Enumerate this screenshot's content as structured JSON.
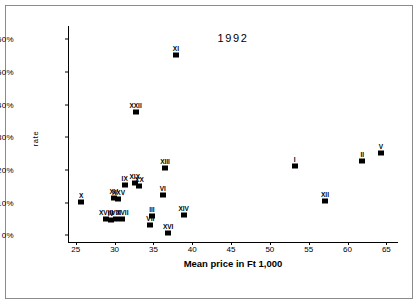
{
  "chart_data": {
    "type": "scatter",
    "title": "1992",
    "xlabel": "Mean price in Ft 1,000",
    "ylabel": "rate",
    "xlim": [
      24,
      66.5
    ],
    "ylim": [
      -2,
      64
    ],
    "grid": false,
    "legend": "none",
    "xticks": [
      25,
      30,
      35,
      40,
      45,
      50,
      55,
      60,
      65
    ],
    "xticklabels": [
      "25",
      "30",
      "35",
      "40",
      "45",
      "50",
      "55",
      "60",
      "65"
    ],
    "yticks": [
      0,
      10,
      20,
      30,
      40,
      50,
      60
    ],
    "yticklabels": [
      "0%",
      "10%",
      "20%",
      "30%",
      "40%",
      "50%",
      "60%"
    ],
    "points": [
      {
        "label": "X",
        "x": 25.7,
        "y": 10.3
      },
      {
        "label": "XVIII",
        "x": 28.9,
        "y": 5.0
      },
      {
        "label": "IV",
        "x": 29.5,
        "y": 4.8
      },
      {
        "label": "VIII",
        "x": 30.2,
        "y": 5.0
      },
      {
        "label": "XVII",
        "x": 31.0,
        "y": 5.1
      },
      {
        "label": "XV",
        "x": 29.9,
        "y": 11.3
      },
      {
        "label": "XXV",
        "x": 30.5,
        "y": 11.2
      },
      {
        "label": "IX",
        "x": 31.3,
        "y": 15.4
      },
      {
        "label": "XIX",
        "x": 32.6,
        "y": 16.0
      },
      {
        "label": "XX",
        "x": 33.2,
        "y": 15.2
      },
      {
        "label": "XXII",
        "x": 32.7,
        "y": 37.6
      },
      {
        "label": "XI",
        "x": 37.9,
        "y": 55.0
      },
      {
        "label": "VII",
        "x": 34.6,
        "y": 3.1
      },
      {
        "label": "III",
        "x": 34.8,
        "y": 6.0
      },
      {
        "label": "XVI",
        "x": 36.9,
        "y": 0.6
      },
      {
        "label": "VI",
        "x": 36.2,
        "y": 12.4
      },
      {
        "label": "XIII",
        "x": 36.5,
        "y": 20.6
      },
      {
        "label": "XIV",
        "x": 38.9,
        "y": 6.4
      },
      {
        "label": "I",
        "x": 53.2,
        "y": 21.3
      },
      {
        "label": "XII",
        "x": 57.1,
        "y": 10.6
      },
      {
        "label": "II",
        "x": 61.9,
        "y": 22.8
      },
      {
        "label": "V",
        "x": 64.3,
        "y": 25.2
      }
    ]
  }
}
